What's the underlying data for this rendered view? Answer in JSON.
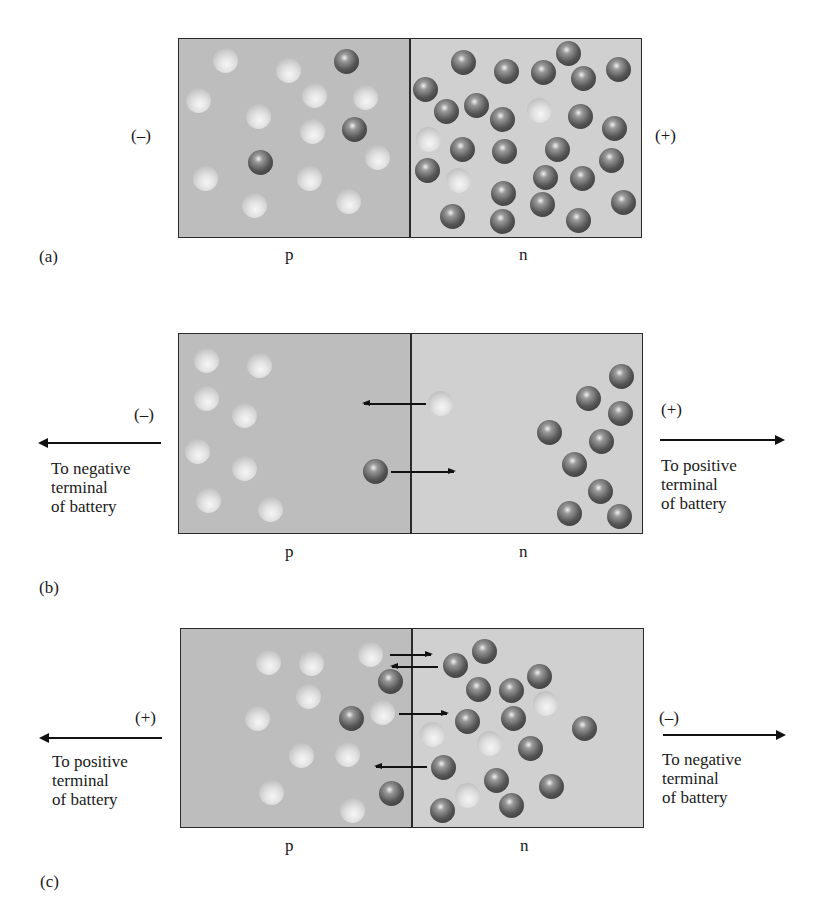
{
  "panels": {
    "a": {
      "tag": "(a)",
      "p_label": "p",
      "n_label": "n",
      "left_polarity": "(–)",
      "right_polarity": "(+)",
      "holes": [
        [
          225,
          60
        ],
        [
          288,
          70
        ],
        [
          198,
          100
        ],
        [
          314,
          95
        ],
        [
          365,
          97
        ],
        [
          258,
          116
        ],
        [
          312,
          131
        ],
        [
          377,
          157
        ],
        [
          205,
          178
        ],
        [
          309,
          178
        ],
        [
          254,
          205
        ],
        [
          348,
          201
        ],
        [
          428,
          139
        ],
        [
          458,
          180
        ],
        [
          539,
          110
        ]
      ],
      "electrons": [
        [
          346,
          61
        ],
        [
          354,
          129
        ],
        [
          260,
          162
        ],
        [
          463,
          62
        ],
        [
          506,
          71
        ],
        [
          543,
          72
        ],
        [
          568,
          53
        ],
        [
          583,
          78
        ],
        [
          618,
          69
        ],
        [
          425,
          89
        ],
        [
          446,
          111
        ],
        [
          476,
          105
        ],
        [
          502,
          119
        ],
        [
          580,
          116
        ],
        [
          614,
          128
        ],
        [
          462,
          149
        ],
        [
          504,
          151
        ],
        [
          557,
          149
        ],
        [
          427,
          170
        ],
        [
          611,
          160
        ],
        [
          503,
          193
        ],
        [
          545,
          177
        ],
        [
          582,
          178
        ],
        [
          452,
          216
        ],
        [
          502,
          221
        ],
        [
          542,
          204
        ],
        [
          578,
          220
        ],
        [
          623,
          202
        ]
      ]
    },
    "b": {
      "tag": "(b)",
      "p_label": "p",
      "n_label": "n",
      "left_polarity": "(–)",
      "right_polarity": "(+)",
      "left_text": "To negative\nterminal\nof battery",
      "right_text": "To positive\nterminal\nof battery",
      "holes": [
        [
          206,
          360
        ],
        [
          259,
          365
        ],
        [
          206,
          398
        ],
        [
          244,
          415
        ],
        [
          197,
          451
        ],
        [
          244,
          468
        ],
        [
          208,
          500
        ],
        [
          270,
          509
        ],
        [
          440,
          403
        ]
      ],
      "electrons": [
        [
          375,
          471
        ],
        [
          621,
          376
        ],
        [
          588,
          398
        ],
        [
          620,
          413
        ],
        [
          549,
          432
        ],
        [
          601,
          441
        ],
        [
          574,
          464
        ],
        [
          600,
          491
        ],
        [
          569,
          513
        ],
        [
          619,
          516
        ]
      ],
      "inner_arrows": [
        {
          "dir": "left",
          "x1": 364,
          "x2": 426,
          "y": 403
        },
        {
          "dir": "right",
          "x1": 391,
          "x2": 454,
          "y": 471
        }
      ]
    },
    "c": {
      "tag": "(c)",
      "p_label": "p",
      "n_label": "n",
      "left_polarity": "(+)",
      "right_polarity": "(–)",
      "left_text": "To positive\nterminal\nof battery",
      "right_text": "To negative\nterminal\nof battery",
      "holes": [
        [
          268,
          662
        ],
        [
          311,
          663
        ],
        [
          370,
          654
        ],
        [
          308,
          696
        ],
        [
          257,
          718
        ],
        [
          382,
          712
        ],
        [
          301,
          755
        ],
        [
          347,
          754
        ],
        [
          271,
          792
        ],
        [
          352,
          810
        ],
        [
          432,
          734
        ],
        [
          489,
          743
        ],
        [
          545,
          703
        ],
        [
          467,
          795
        ]
      ],
      "electrons": [
        [
          390,
          681
        ],
        [
          351,
          718
        ],
        [
          391,
          793
        ],
        [
          455,
          665
        ],
        [
          484,
          651
        ],
        [
          478,
          689
        ],
        [
          511,
          690
        ],
        [
          467,
          721
        ],
        [
          513,
          718
        ],
        [
          539,
          676
        ],
        [
          584,
          728
        ],
        [
          530,
          748
        ],
        [
          443,
          767
        ],
        [
          496,
          780
        ],
        [
          551,
          786
        ],
        [
          442,
          810
        ],
        [
          511,
          805
        ]
      ],
      "inner_arrows": [
        {
          "dir": "right",
          "x1": 390,
          "x2": 431,
          "y": 654
        },
        {
          "dir": "left",
          "x1": 392,
          "x2": 438,
          "y": 666
        },
        {
          "dir": "right",
          "x1": 399,
          "x2": 447,
          "y": 713
        },
        {
          "dir": "left",
          "x1": 376,
          "x2": 427,
          "y": 766
        }
      ]
    }
  }
}
